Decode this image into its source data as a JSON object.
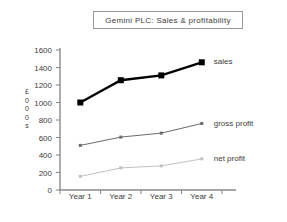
{
  "chart_data": {
    "type": "line",
    "title": "Gemini PLC: Sales & profitability",
    "xlabel": "",
    "ylabel": "£000s",
    "ylabel_chars": [
      "£",
      "0",
      "0",
      "0",
      "s"
    ],
    "categories": [
      "Year 1",
      "Year 2",
      "Year 3",
      "Year 4"
    ],
    "ylim": [
      0,
      1600
    ],
    "yticks": [
      0,
      200,
      400,
      600,
      800,
      1000,
      1200,
      1400,
      1600
    ],
    "ytick_labels": [
      "0",
      "200",
      "400",
      "600",
      "800",
      "1000",
      "1200",
      "1400",
      "1600"
    ],
    "grid": false,
    "legend_position": "right-inline",
    "series": [
      {
        "name": "sales",
        "values": [
          1000,
          1255,
          1310,
          1460
        ],
        "color": "#000000",
        "line_width": 2.4,
        "marker": "square",
        "marker_size": 6
      },
      {
        "name": "gross profit",
        "values": [
          510,
          605,
          650,
          760
        ],
        "color": "#6b6b6b",
        "line_width": 1,
        "marker": "square",
        "marker_size": 3
      },
      {
        "name": "net profit",
        "values": [
          155,
          253,
          275,
          355
        ],
        "color": "#c2c2c2",
        "line_width": 1,
        "marker": "square",
        "marker_size": 3
      }
    ],
    "axis_color": "#8a8a8a",
    "title_border_color": "#9a9a9a",
    "background": "#ffffff"
  }
}
